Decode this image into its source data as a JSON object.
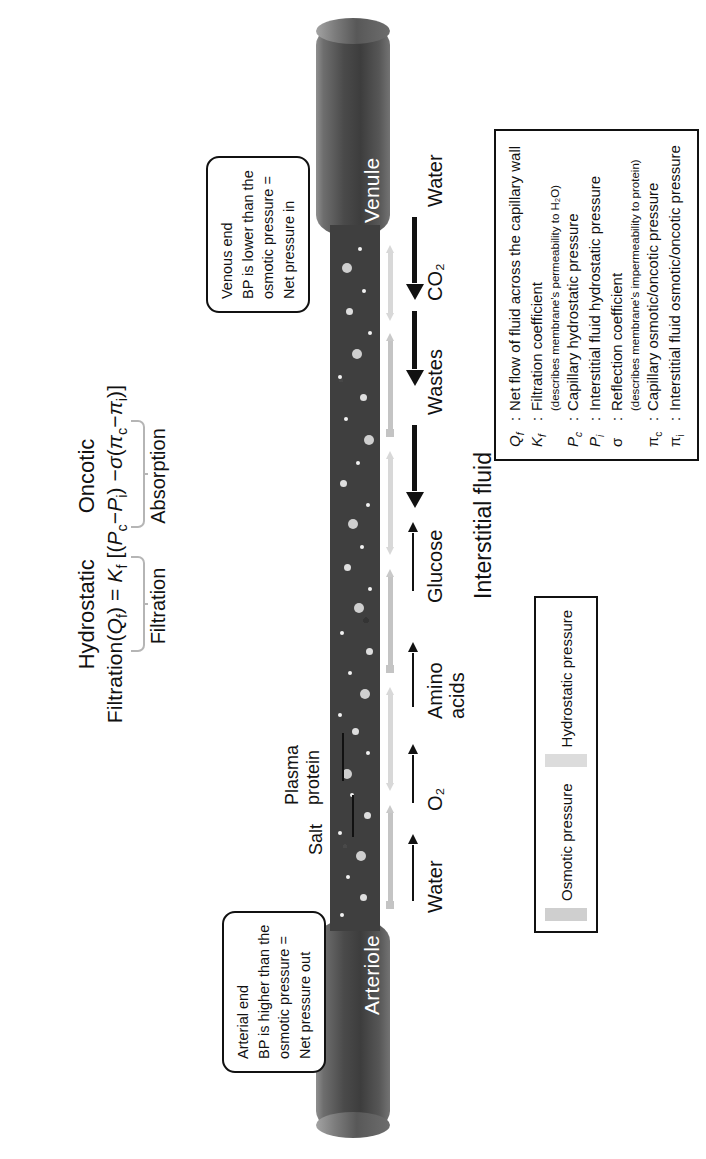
{
  "diagram": {
    "vessels": {
      "arteriole_label": "Arteriole",
      "venule_label": "Venule"
    },
    "interstitial_fluid_label": "Interstitial fluid",
    "callouts": {
      "arterial": {
        "line1": "Arterial end",
        "line2": "BP is higher than the",
        "line3": "osmotic pressure =",
        "line4": "Net pressure out"
      },
      "venous": {
        "line1": "Venous end",
        "line2": "BP is lower than the",
        "line3": "osmotic pressure =",
        "line4": "Net pressure in"
      }
    },
    "formula": {
      "header_hydrostatic": "Hydrostatic",
      "header_oncotic": "Oncotic",
      "equation_plain": "Filtration(Qf) = Kf [(Pc − Pi) − σ(πc − πi)]",
      "equation_prefix": "Filtration(",
      "equation_q": "Q",
      "equation_q_sub": "f",
      "equation_eq": ") = ",
      "equation_k": "K",
      "equation_k_sub": "f",
      "equation_open": " [(",
      "equation_pc": "P",
      "equation_pc_sub": "c",
      "equation_minus1": "−",
      "equation_pi_h": "P",
      "equation_pi_h_sub": "i",
      "equation_mid": ") −",
      "equation_sigma": "σ",
      "equation_open2": "(",
      "equation_pic": "π",
      "equation_pic_sub": "c",
      "equation_minus2": "−",
      "equation_pii": "π",
      "equation_pii_sub": "i",
      "equation_close": ")]",
      "brace_label_filtration": "Filtration",
      "brace_label_absorption": "Absorption"
    },
    "substances": [
      {
        "name": "Water",
        "direction": "out"
      },
      {
        "name": "O₂",
        "direction": "out"
      },
      {
        "name": "Amino acids",
        "direction": "out"
      },
      {
        "name": "Glucose",
        "direction": "out"
      },
      {
        "name": "Wastes",
        "direction": "in"
      },
      {
        "name": "CO₂",
        "direction": "in"
      },
      {
        "name": "Water",
        "direction": "in"
      }
    ],
    "inline_labels": [
      {
        "name": "Salt"
      },
      {
        "name": "Plasma",
        "name2": "protein"
      }
    ],
    "pressure_key": {
      "items": [
        {
          "label": "Osmotic pressure",
          "color": "#cfcfcf"
        },
        {
          "label": "Hydrostatic pressure",
          "color": "#dcdcdc"
        }
      ]
    },
    "symbol_legend": {
      "rows": [
        {
          "sym": "Q",
          "sub": "f",
          "colon": ":",
          "text": "Net flow of fluid across the capillary wall",
          "note": ""
        },
        {
          "sym": "K",
          "sub": "f",
          "colon": ":",
          "text": "Filtration coefficient",
          "note": "(describes membrane’s permeability to H₂O)"
        },
        {
          "sym": "P",
          "sub": "c",
          "colon": ":",
          "text": "Capillary hydrostatic pressure",
          "note": ""
        },
        {
          "sym": "P",
          "sub": "i",
          "colon": ":",
          "text": "Interstitial fluid hydrostatic pressure",
          "note": ""
        },
        {
          "sym": "σ",
          "sub": "",
          "colon": ":",
          "text": "Reflection coefficient",
          "note": "(describes membrane’s impermeability to protein)"
        },
        {
          "sym": "π",
          "sub": "c",
          "colon": ":",
          "text": "Capillary osmotic/oncotic pressure",
          "note": ""
        },
        {
          "sym": "π",
          "sub": "i",
          "colon": ":",
          "text": "Interstitial fluid osmotic/oncotic pressure",
          "note": ""
        }
      ]
    }
  }
}
